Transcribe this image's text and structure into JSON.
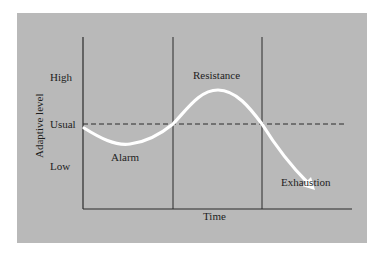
{
  "diagram": {
    "y_axis_label": "Adaptive level",
    "x_axis_label": "Time",
    "y_levels": {
      "high": "High",
      "usual": "Usual",
      "low": "Low"
    },
    "stages": [
      {
        "name": "Alarm"
      },
      {
        "name": "Resistance"
      },
      {
        "name": "Exhaustion"
      }
    ],
    "colors": {
      "panel_background": "#b9b9b9",
      "curve": "#ffffff",
      "axis_lines": "#2a2a2a",
      "text": "#1e1e1e"
    }
  }
}
